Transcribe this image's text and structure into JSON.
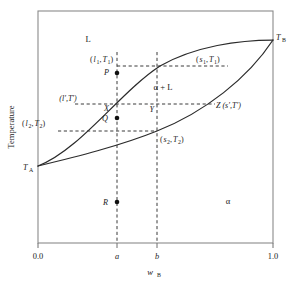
{
  "figure": {
    "name": "binary-phase-diagram",
    "axes": {
      "x": {
        "label_main": "w",
        "label_sub": "B",
        "ticks": [
          {
            "value": 0.0,
            "label": "0.0",
            "px": 38
          },
          {
            "value": 0.33,
            "label": "a",
            "px": 117,
            "italic": true
          },
          {
            "value": 0.505,
            "label": "b",
            "px": 157,
            "italic": true
          },
          {
            "value": 1.0,
            "label": "1.0",
            "px": 273
          }
        ],
        "range": [
          0.0,
          1.0
        ]
      },
      "y": {
        "label": "Temperature",
        "endpoints": [
          {
            "name": "T_A",
            "main": "T",
            "sub": "A",
            "px_y": 166
          },
          {
            "name": "T_B",
            "main": "T",
            "sub": "B",
            "px_y": 40
          }
        ]
      }
    },
    "regions": [
      {
        "id": "liquid",
        "label": "L",
        "x": 88,
        "y": 42
      },
      {
        "id": "two-phase",
        "label": "α + L",
        "x": 163,
        "y": 90
      },
      {
        "id": "solid",
        "label": "α",
        "x": 228,
        "y": 204
      }
    ],
    "curves": [
      {
        "id": "liquidus",
        "description": "upper boundary from T_A to T_B",
        "path": "M 38 166 C 80 150, 120 92, 160 66 C 195 46, 240 40, 273 40"
      },
      {
        "id": "solidus",
        "description": "lower boundary from T_A to T_B",
        "path": "M 38 166 C 75 157, 120 146, 157 131 C 205 112, 248 78, 273 40"
      }
    ],
    "tie_lines": [
      {
        "id": "T1",
        "y": 66,
        "x1": 117,
        "x2": 228,
        "left_label": {
          "text": "(l₁,T₁)",
          "main": "(l",
          "sub": "1",
          "tail": ",T",
          "sub2": "1",
          "close": ")"
        },
        "right_label": "(s₁,T₁)"
      },
      {
        "id": "Tprime",
        "y": 104,
        "x1": 75,
        "x2": 215,
        "left_label": "(l′,T′)",
        "right_label": "Z (s′,T′)"
      },
      {
        "id": "T2",
        "y": 131,
        "x1": 58,
        "x2": 157,
        "left_label": "(l₂,T₂)",
        "right_label": "(s₂,T₂)"
      }
    ],
    "vertical_lines": [
      {
        "id": "line-a",
        "x": 117,
        "y1": 52,
        "y2": 243
      },
      {
        "id": "line-b",
        "x": 157,
        "y1": 52,
        "y2": 243
      }
    ],
    "points": [
      {
        "id": "P",
        "label": "P",
        "x": 117,
        "y": 73,
        "marker": true,
        "label_dx": -8,
        "label_dy": 2
      },
      {
        "id": "X",
        "label": "X",
        "x": 117,
        "y": 104,
        "marker": false,
        "label_dx": -8,
        "label_dy": 7
      },
      {
        "id": "Q",
        "label": "Q",
        "x": 117,
        "y": 118,
        "marker": true,
        "label_dx": -9,
        "label_dy": 3
      },
      {
        "id": "R",
        "label": "R",
        "x": 117,
        "y": 202,
        "marker": true,
        "label_dx": -9,
        "label_dy": 3
      },
      {
        "id": "Y",
        "label": "Y",
        "x": 157,
        "y": 104,
        "marker": false,
        "label_dx": -3,
        "label_dy": 8
      }
    ],
    "annotations": {
      "l1T1": {
        "open": "(",
        "l": "l",
        "l_sub": "1",
        "comma": ",",
        "T": "T",
        "T_sub": "1",
        "close": ")",
        "x": 110,
        "y": 62
      },
      "s1T1": {
        "open": "(",
        "s": "s",
        "s_sub": "1",
        "comma": ",",
        "T": "T",
        "T_sub": "1",
        "close": ")",
        "x": 205,
        "y": 62
      },
      "lpTp": {
        "text": "(l′,T′)",
        "x": 68,
        "y": 101
      },
      "ZspTp": {
        "text": "Z (s′,T′)",
        "x": 216,
        "y": 108
      },
      "l2T2": {
        "open": "(",
        "l": "l",
        "l_sub": "2",
        "comma": ",",
        "T": "T",
        "T_sub": "2",
        "close": ")",
        "x": 36,
        "y": 126
      },
      "s2T2": {
        "open": "(",
        "s": "s",
        "s_sub": "2",
        "comma": ",",
        "T": "T",
        "T_sub": "2",
        "close": ")",
        "x": 150,
        "y": 142
      }
    },
    "colors": {
      "frame": "#8a8a8a",
      "curve": "#2b2b2b",
      "dashed": "#3a3a3a",
      "text": "#1a1a1a",
      "background": "#ffffff"
    }
  }
}
